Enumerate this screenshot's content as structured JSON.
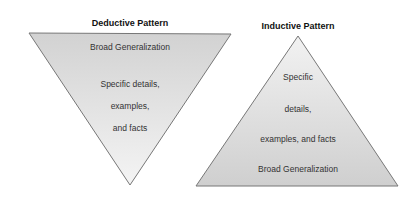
{
  "deductive": {
    "title": "Deductive Pattern",
    "top_label": "Broad Generalization",
    "lines": [
      "Specific details,",
      "examples,",
      "and facts"
    ]
  },
  "inductive": {
    "title": "Inductive Pattern",
    "lines": [
      "Specific",
      "details,",
      "examples, and facts"
    ],
    "bottom_label": "Broad Generalization"
  },
  "colors": {
    "fill_dark": "#d2d2d2",
    "fill_light": "#f2f2f2",
    "stroke": "#777777",
    "text": "#333333"
  }
}
